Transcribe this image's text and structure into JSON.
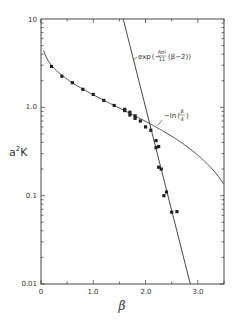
{
  "chart_data": {
    "type": "scatter",
    "title": "",
    "xlabel": "β",
    "ylabel": "a²K",
    "xlim": [
      0,
      3.5
    ],
    "ylim": [
      0.01,
      10
    ],
    "yscale": "log",
    "grid": false,
    "x_ticks": [
      {
        "value": 0,
        "label": "0"
      },
      {
        "value": 1.0,
        "label": "1.0"
      },
      {
        "value": 2.0,
        "label": "2.0"
      },
      {
        "value": 3.0,
        "label": "3.0"
      }
    ],
    "y_ticks": [
      {
        "value": 10,
        "label": "10"
      },
      {
        "value": 1.0,
        "label": "1.0"
      },
      {
        "value": 0.1,
        "label": "0.1"
      },
      {
        "value": 0.01,
        "label": "0.01"
      }
    ],
    "series": [
      {
        "name": "measured",
        "kind": "points",
        "x": [
          0.2,
          0.4,
          0.6,
          0.8,
          1.0,
          1.2,
          1.4,
          1.6,
          1.6,
          1.7,
          1.7,
          1.8,
          1.8,
          1.9,
          2.0,
          2.1,
          2.2,
          2.2,
          2.25,
          2.25,
          2.3,
          2.35,
          2.4,
          2.5,
          2.6
        ],
        "y": [
          2.9,
          2.25,
          1.9,
          1.6,
          1.4,
          1.2,
          1.05,
          0.95,
          0.92,
          0.88,
          0.82,
          0.8,
          0.75,
          0.7,
          0.6,
          0.55,
          0.42,
          0.35,
          0.36,
          0.21,
          0.2,
          0.1,
          0.11,
          0.065,
          0.066
        ]
      },
      {
        "name": "-ln(β/4)",
        "kind": "curve",
        "formula": "-ln(beta/4)"
      },
      {
        "name": "exp(-6π²/11 (β-2))",
        "kind": "curve",
        "formula": "exp(-6*pi^2/11*(beta-2))"
      }
    ],
    "annotations": [
      {
        "text_main": "exp",
        "text_num": "6π²",
        "text_den": "11",
        "text_tail": "(β−2)",
        "target": "exp(-6π²/11 (β-2))"
      },
      {
        "text_main": "−ln",
        "text_num": "β",
        "text_den": "4",
        "target": "-ln(β/4)"
      }
    ]
  },
  "labels": {
    "xlabel": "β",
    "ylabel_base": "a",
    "ylabel_sup": "2",
    "ylabel_tail": "K",
    "x_tick_0": "0",
    "x_tick_1": "1.0",
    "x_tick_2": "2.0",
    "x_tick_3": "3.0",
    "y_tick_10": "10",
    "y_tick_1": "1.0",
    "y_tick_01": "0.1",
    "y_tick_001": "0.01",
    "exp_prefix": "exp",
    "exp_open": "(−",
    "exp_num": "6π²",
    "exp_den": "11",
    "exp_tail": "(β−2))",
    "ln_prefix": "−ln",
    "ln_open": "(",
    "ln_num": "β",
    "ln_den": "4",
    "ln_close": ")"
  }
}
